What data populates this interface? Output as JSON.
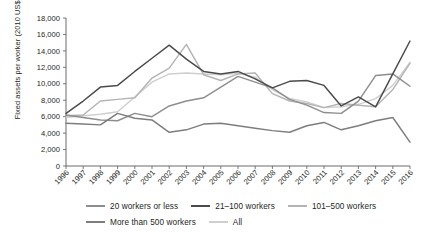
{
  "chart_data": {
    "type": "line",
    "title": "",
    "xlabel": "",
    "ylabel": "Fixed assets per worker (2010 US$)",
    "ylim": [
      0,
      18000
    ],
    "ytick_step": 2000,
    "yticks": [
      "18,000",
      "16,000",
      "14,000",
      "12,000",
      "10,000",
      "8,000",
      "6,000",
      "4,000",
      "2,000",
      "0"
    ],
    "ytick_values": [
      18000,
      16000,
      14000,
      12000,
      10000,
      8000,
      6000,
      4000,
      2000,
      0
    ],
    "grid": false,
    "legend_position": "bottom",
    "categories": [
      "1996",
      "1997",
      "1998",
      "1999",
      "2000",
      "2001",
      "2002",
      "2003",
      "2004",
      "2005",
      "2006",
      "2007",
      "2008",
      "2009",
      "2010",
      "2011",
      "2012",
      "2013",
      "2014",
      "2015",
      "2016"
    ],
    "x": [
      1996,
      1997,
      1998,
      1999,
      2000,
      2001,
      2002,
      2003,
      2004,
      2005,
      2006,
      2007,
      2008,
      2009,
      2010,
      2011,
      2012,
      2013,
      2014,
      2015,
      2016
    ],
    "series": [
      {
        "name": "20 workers or less",
        "color": "#8e8e8e",
        "values": [
          6200,
          5900,
          5600,
          5500,
          6400,
          6000,
          7300,
          7900,
          8300,
          9600,
          10900,
          10200,
          9500,
          8100,
          7400,
          6500,
          6400,
          7900,
          11000,
          11200,
          9700
        ]
      },
      {
        "name": "21–100 workers",
        "color": "#4a4a4a",
        "values": [
          6400,
          7900,
          9600,
          9800,
          11500,
          13100,
          14700,
          13000,
          11500,
          11200,
          11500,
          10600,
          9500,
          10300,
          10400,
          9800,
          7300,
          8400,
          7200,
          11200,
          15200
        ]
      },
      {
        "name": "101–500 workers",
        "color": "#b4b4b4",
        "values": [
          6100,
          6200,
          7900,
          8100,
          8300,
          10700,
          11900,
          14800,
          11100,
          10400,
          11200,
          11300,
          8800,
          7900,
          7600,
          7100,
          7600,
          7400,
          7200,
          9300,
          12500
        ]
      },
      {
        "name": "More than 500 workers",
        "color": "#7d7d7d",
        "values": [
          5200,
          5100,
          5000,
          6400,
          5800,
          5600,
          4100,
          4400,
          5100,
          5200,
          4900,
          4600,
          4300,
          4100,
          4900,
          5300,
          4400,
          4900,
          5500,
          5900,
          2900
        ]
      },
      {
        "name": "All",
        "color": "#cfcfcf",
        "values": [
          5900,
          6100,
          6300,
          6600,
          8400,
          10200,
          11200,
          11300,
          11200,
          11100,
          11300,
          10800,
          9300,
          8200,
          7800,
          7100,
          7200,
          7500,
          8200,
          9800,
          12600
        ]
      }
    ]
  }
}
